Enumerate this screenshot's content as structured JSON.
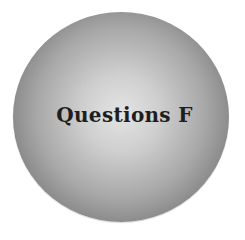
{
  "badge": {
    "title": "Questions F",
    "colors": {
      "center": "#e4e4e4",
      "edge": "#616161",
      "text": "#1e1e1e",
      "background": "#ffffff"
    }
  }
}
